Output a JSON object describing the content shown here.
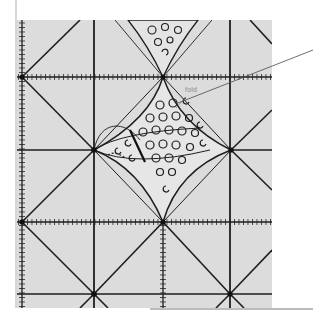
{
  "figure": {
    "type": "quilting-technique-illustration",
    "colors": {
      "background": "#ffffff",
      "mat": "#dcdcdc",
      "lines": "#1e1e1e",
      "label": "#8a8a8a",
      "leader": "#4a4a4a"
    }
  },
  "annotations": {
    "fold_label": "fold"
  },
  "grid": {
    "vertical_lines_x": [
      22,
      94,
      163,
      230
    ],
    "horizontal_lines_y": [
      77,
      150,
      222,
      294
    ],
    "nodes": [
      [
        22,
        77
      ],
      [
        163,
        77
      ],
      [
        94,
        150
      ],
      [
        231,
        150
      ],
      [
        22,
        222
      ],
      [
        163,
        222
      ],
      [
        94,
        294
      ],
      [
        230,
        294
      ]
    ]
  }
}
